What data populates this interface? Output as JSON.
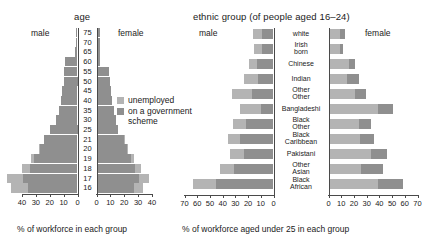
{
  "chart_data": [
    {
      "type": "bar",
      "subtype": "population-pyramid-horizontal",
      "title": "age",
      "left_panel_label": "male",
      "right_panel_label": "female",
      "xlabel": "% of workforce in each group",
      "ylabel": "age",
      "categories": [
        "75",
        "70",
        "65",
        "60",
        "55",
        "50",
        "45",
        "40",
        "35",
        "30",
        "25",
        "21",
        "20",
        "19",
        "18",
        "17",
        "16"
      ],
      "left_axis_ticks": [
        "40",
        "30",
        "20",
        "10",
        "0"
      ],
      "right_axis_ticks": [
        "0",
        "10",
        "20",
        "30",
        "40"
      ],
      "xlim": [
        0,
        40
      ],
      "grid": false,
      "legend": [
        "unemployed",
        "on a government scheme"
      ],
      "legend_position": "center-right",
      "series": [
        {
          "name": "male unemployed",
          "side": "left",
          "values": [
            1.0,
            1.0,
            1.5,
            9.0,
            9.5,
            10.0,
            11.0,
            12.0,
            13.5,
            15.5,
            20.0,
            24.0,
            27.0,
            31.0,
            34.0,
            39.0,
            36.0
          ]
        },
        {
          "name": "male on a government scheme",
          "side": "left",
          "values": [
            0.0,
            0.0,
            0.0,
            0.0,
            0.0,
            0.0,
            0.0,
            0.0,
            0.0,
            0.0,
            0.0,
            0.5,
            1.0,
            2.5,
            6.0,
            12.0,
            12.0
          ]
        },
        {
          "name": "female unemployed",
          "side": "right",
          "values": [
            1.5,
            1.5,
            1.5,
            2.0,
            8.5,
            9.0,
            9.5,
            10.5,
            12.0,
            13.0,
            15.0,
            19.0,
            21.0,
            24.0,
            27.0,
            30.0,
            26.0
          ]
        },
        {
          "name": "female on a government scheme",
          "side": "right",
          "values": [
            0.0,
            0.0,
            0.0,
            0.0,
            0.0,
            0.0,
            0.0,
            0.0,
            0.0,
            0.0,
            0.0,
            0.5,
            1.0,
            2.0,
            4.5,
            7.0,
            7.0
          ]
        }
      ]
    },
    {
      "type": "bar",
      "subtype": "diverging-horizontal",
      "title": "ethnic group (of people aged 16–24)",
      "left_panel_label": "male",
      "right_panel_label": "female",
      "xlabel": "% of workforce aged under 25 in each group",
      "categories": [
        "white",
        "Irish born",
        "Chinese",
        "Indian",
        "Other Other",
        "Bangladeshi",
        "Black Other",
        "Black Caribbean",
        "Pakistani",
        "Other Asian",
        "Black African"
      ],
      "category_lines": [
        [
          "white"
        ],
        [
          "Irish",
          "born"
        ],
        [
          "Chinese"
        ],
        [
          "Indian"
        ],
        [
          "Other",
          "Other"
        ],
        [
          "Bangladeshi"
        ],
        [
          "Black",
          "Other"
        ],
        [
          "Black",
          "Caribbean"
        ],
        [
          "Pakistani"
        ],
        [
          "Other",
          "Asian"
        ],
        [
          "Black",
          "African"
        ]
      ],
      "left_axis_ticks": [
        "70",
        "60",
        "50",
        "40",
        "30",
        "20",
        "10",
        "0"
      ],
      "right_axis_ticks": [
        "0",
        "10",
        "20",
        "30",
        "40",
        "50",
        "60",
        "70"
      ],
      "xlim": [
        0,
        70
      ],
      "grid": false,
      "legend": [
        "unemployed",
        "on a government scheme"
      ],
      "series": [
        {
          "name": "male unemployed",
          "side": "left",
          "values": [
            9.0,
            9.0,
            13.0,
            12.0,
            17.0,
            10.0,
            22.0,
            26.0,
            23.0,
            31.0,
            45.0
          ]
        },
        {
          "name": "male on a government scheme",
          "side": "left",
          "values": [
            7.0,
            6.5,
            6.0,
            11.0,
            16.0,
            16.0,
            10.0,
            10.0,
            11.0,
            11.0,
            18.0
          ]
        },
        {
          "name": "female unemployed",
          "side": "right",
          "values": [
            8.0,
            8.0,
            15.0,
            14.0,
            20.0,
            38.0,
            23.0,
            24.0,
            33.0,
            25.0,
            38.0
          ]
        },
        {
          "name": "female on a government scheme",
          "side": "right",
          "values": [
            4.0,
            3.0,
            5.0,
            9.0,
            9.0,
            12.0,
            10.0,
            11.0,
            12.0,
            17.0,
            20.0
          ]
        }
      ]
    }
  ],
  "figure": {
    "pyramid": {
      "title": "age",
      "male_label": "male",
      "female_label": "female",
      "xlabel": "% of workforce in each group",
      "age_labels": [
        "75",
        "70",
        "65",
        "60",
        "55",
        "50",
        "45",
        "40",
        "35",
        "30",
        "25",
        "21",
        "20",
        "19",
        "18",
        "17",
        "16"
      ],
      "left_ticks": [
        "40",
        "30",
        "20",
        "10",
        "0"
      ],
      "right_ticks": [
        "0",
        "10",
        "20",
        "30",
        "40"
      ]
    },
    "ethnic": {
      "title": "ethnic group (of people aged 16–24)",
      "male_label": "male",
      "female_label": "female",
      "xlabel": "% of workforce aged under 25 in each group",
      "left_ticks": [
        "70",
        "60",
        "50",
        "40",
        "30",
        "20",
        "10",
        "0"
      ],
      "right_ticks": [
        "0",
        "10",
        "20",
        "30",
        "40",
        "50",
        "60",
        "70"
      ]
    },
    "legend": {
      "unemployed": "unemployed",
      "scheme_line1": "on a government",
      "scheme_line2": "scheme"
    },
    "colors": {
      "unemployed": "#b4b4b4",
      "scheme": "#8f8f8f",
      "axis": "#4a4a4a",
      "text": "#1a1a1a"
    }
  }
}
